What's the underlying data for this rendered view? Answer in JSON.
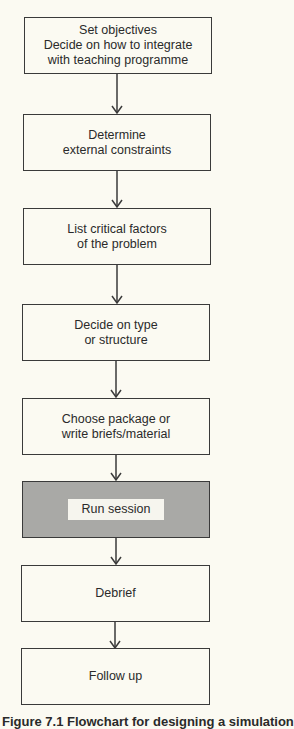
{
  "flowchart": {
    "steps": [
      {
        "label": "Set objectives\nDecide on how to integrate\nwith teaching programme",
        "highlighted": false
      },
      {
        "label": "Determine\nexternal constraints",
        "highlighted": false
      },
      {
        "label": "List critical factors\nof the problem",
        "highlighted": false
      },
      {
        "label": "Decide on type\nor structure",
        "highlighted": false
      },
      {
        "label": "Choose package or\nwrite briefs/material",
        "highlighted": false
      },
      {
        "label": "Run session",
        "highlighted": true
      },
      {
        "label": "Debrief",
        "highlighted": false
      },
      {
        "label": "Follow up",
        "highlighted": false
      }
    ],
    "connector": "arrow-down",
    "colors": {
      "background": "#fbfaf2",
      "border": "#3a3a3a",
      "highlight_fill": "#a9a9a6",
      "text": "#2a2a2a"
    }
  },
  "caption": "Figure 7.1 Flowchart for designing a simulation"
}
